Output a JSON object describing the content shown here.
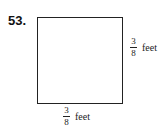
{
  "problem_number": "53.",
  "shape": "square",
  "labels": {
    "right": {
      "numerator": "3",
      "denominator": "8",
      "unit": "feet"
    },
    "bottom": {
      "numerator": "3",
      "denominator": "8",
      "unit": "feet"
    }
  }
}
